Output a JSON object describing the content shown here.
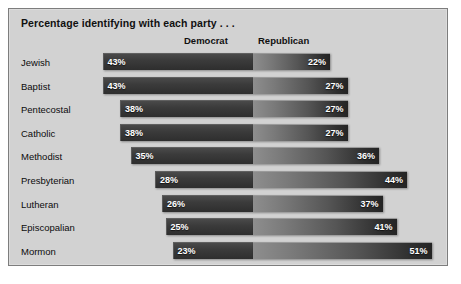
{
  "panel": {
    "title": "Percentage identifying with each party . . ."
  },
  "headers": {
    "democrat": "Democrat",
    "republican": "Republican"
  },
  "chart_data": {
    "type": "bar",
    "title": "Percentage identifying with each party . . .",
    "subtype": "diverging-horizontal-bar",
    "xlabel": "",
    "ylabel": "",
    "grid": false,
    "legend_position": "top",
    "legend": [
      "Democrat",
      "Republican"
    ],
    "categories": [
      "Jewish",
      "Baptist",
      "Pentecostal",
      "Catholic",
      "Methodist",
      "Presbyterian",
      "Lutheran",
      "Episcopalian",
      "Mormon"
    ],
    "series": [
      {
        "name": "Democrat",
        "direction": "left",
        "values": [
          43,
          43,
          38,
          38,
          35,
          28,
          26,
          25,
          23
        ],
        "labels": [
          "43%",
          "43%",
          "38%",
          "38%",
          "35%",
          "28%",
          "26%",
          "25%",
          "23%"
        ]
      },
      {
        "name": "Republican",
        "direction": "right",
        "values": [
          22,
          27,
          27,
          27,
          36,
          44,
          37,
          41,
          51
        ],
        "labels": [
          "22%",
          "27%",
          "27%",
          "27%",
          "36%",
          "44%",
          "37%",
          "41%",
          "51%"
        ]
      }
    ],
    "xlim": [
      -55,
      55
    ],
    "units": "percent"
  },
  "colors": {
    "panel_background": "#d2d2d2",
    "panel_border": "#7d7d7d",
    "democrat_bar": "#3b3b3b",
    "republican_bar_light": "#8e8e8e",
    "republican_bar_dark": "#242424",
    "value_text": "#ffffff",
    "label_text": "#0c0c0c"
  }
}
